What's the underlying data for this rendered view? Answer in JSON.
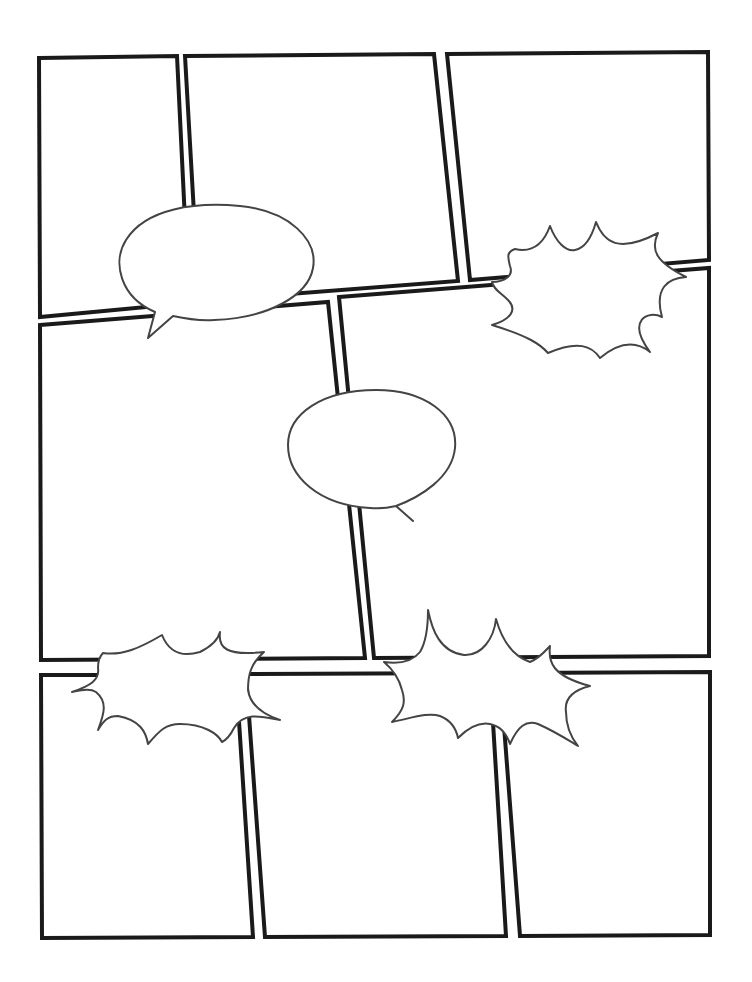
{
  "page": {
    "title": "",
    "background": "#ffffff",
    "panel_stroke": "#1a1a1a",
    "bubble_stroke": "#444444"
  },
  "panels": [
    {
      "id": "panel-1",
      "points": "39,58 177,56 189,303 40,317"
    },
    {
      "id": "panel-2",
      "points": "185,56 434,54 458,281 199,301"
    },
    {
      "id": "panel-3",
      "points": "447,54 708,52 709,260 470,280"
    },
    {
      "id": "panel-4",
      "points": "40,325 328,302 365,658 41,660"
    },
    {
      "id": "panel-5",
      "points": "339,297 709,268 709,656 374,658"
    },
    {
      "id": "panel-6",
      "points": "41,675 236,675 253,937 42,938"
    },
    {
      "id": "panel-7",
      "points": "246,674 490,673 506,936 265,937"
    },
    {
      "id": "panel-8",
      "points": "500,673 710,672 710,935 520,936"
    }
  ],
  "bubbles": [
    {
      "id": "speech-bubble-1",
      "type": "speech",
      "path": "M155,312 C120,297 112,262 126,240 C146,208 196,202 240,206 C290,211 318,240 313,268 C308,296 268,318 214,320 C196,321 182,318 173,316 L148,338 Z"
    },
    {
      "id": "speech-bubble-2",
      "type": "speech",
      "path": "M396,506 C420,497 452,478 455,448 C458,414 424,390 376,390 C322,390 288,414 288,445 C288,476 318,505 370,508 C380,509 388,508 396,506 L413,521 Z"
    },
    {
      "id": "burst-bubble-1",
      "type": "burst",
      "path": "M515,249 C528,252 542,248 550,226 C556,242 566,252 575,250 C586,248 592,236 596,222 C604,242 618,254 658,233 C650,250 656,262 686,277 C668,278 654,288 662,317 C648,310 626,320 650,352 C640,344 624,338 600,358 C592,346 578,340 548,353 C540,344 528,336 492,325 C510,320 518,310 508,300 C500,292 494,290 492,282 C504,282 514,276 510,266 C508,258 506,252 515,249 Z"
    },
    {
      "id": "burst-bubble-2",
      "type": "burst",
      "path": "M103,653 C122,656 140,648 162,635 C168,650 180,658 200,652 C212,646 218,640 220,632 C218,648 226,656 264,652 C250,664 248,676 248,690 C250,704 262,714 280,720 C260,716 244,712 234,728 C230,736 226,740 222,742 C218,734 204,724 180,724 C166,724 160,730 148,744 C146,732 140,720 118,716 C108,716 104,720 98,730 C104,714 108,702 96,692 C90,688 82,690 72,692 C90,686 100,680 98,668 C98,660 100,656 103,653 Z"
    },
    {
      "id": "burst-bubble-3",
      "type": "burst",
      "path": "M428,610 C432,630 440,652 464,655 C482,656 494,638 496,619 C502,640 512,656 530,662 C540,658 546,650 550,646 C548,662 552,676 590,686 C574,690 564,698 566,712 C566,724 570,736 578,746 C568,740 556,732 538,724 C526,720 518,726 510,744 C506,732 500,726 490,724 C480,722 470,726 458,738 C456,728 450,720 440,716 C428,712 412,718 392,722 C404,710 406,702 402,690 C400,682 396,672 384,662 C398,664 412,662 420,652 C426,642 428,626 428,610 Z"
    }
  ]
}
